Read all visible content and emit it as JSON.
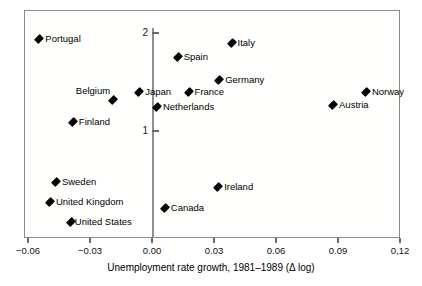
{
  "chart_data": {
    "type": "scatter",
    "title": "",
    "xlabel": "Unemployment rate growth, 1981–1989 (Δ log)",
    "ylabel": "",
    "xlim": [
      -0.075,
      0.1325
    ],
    "ylim": [
      0.08,
      2.15
    ],
    "grid": false,
    "legend": "none",
    "xticks": [
      {
        "value": -0.06,
        "label": "−0.06"
      },
      {
        "value": -0.03,
        "label": "−0.03"
      },
      {
        "value": 0.0,
        "label": "0.00"
      },
      {
        "value": 0.03,
        "label": "0.03"
      },
      {
        "value": 0.06,
        "label": "0.06"
      },
      {
        "value": 0.09,
        "label": "0.09"
      },
      {
        "value": 0.12,
        "label": "0,12"
      }
    ],
    "yticks": [
      {
        "value": 2,
        "label": "2"
      },
      {
        "value": 1,
        "label": "1"
      }
    ],
    "points": [
      {
        "label": "Portugal",
        "x": -0.0545,
        "y": 1.934,
        "label_pos": "right"
      },
      {
        "label": "Italy",
        "x": 0.0385,
        "y": 1.897,
        "label_pos": "right"
      },
      {
        "label": "Spain",
        "x": 0.0124,
        "y": 1.755,
        "label_pos": "right"
      },
      {
        "label": "Germany",
        "x": 0.0325,
        "y": 1.52,
        "label_pos": "right"
      },
      {
        "label": "Norway",
        "x": 0.1035,
        "y": 1.398,
        "label_pos": "right"
      },
      {
        "label": "France",
        "x": 0.0177,
        "y": 1.398,
        "label_pos": "right"
      },
      {
        "label": "Japan",
        "x": -0.0062,
        "y": 1.398,
        "label_pos": "right"
      },
      {
        "label": "Belgium",
        "x": -0.0188,
        "y": 1.316,
        "label_pos": "above-left"
      },
      {
        "label": "Austria",
        "x": 0.0876,
        "y": 1.265,
        "label_pos": "right"
      },
      {
        "label": "Netherlands",
        "x": 0.0024,
        "y": 1.245,
        "label_pos": "right"
      },
      {
        "label": "Finland",
        "x": -0.0383,
        "y": 1.092,
        "label_pos": "right"
      },
      {
        "label": "Sweden",
        "x": -0.0465,
        "y": 0.479,
        "label_pos": "right"
      },
      {
        "label": "Ireland",
        "x": 0.032,
        "y": 0.429,
        "label_pos": "right"
      },
      {
        "label": "United Kingdom",
        "x": -0.0494,
        "y": 0.276,
        "label_pos": "right"
      },
      {
        "label": "Canada",
        "x": 0.0062,
        "y": 0.214,
        "label_pos": "right"
      },
      {
        "label": "United States",
        "x": -0.0393,
        "y": 0.071,
        "label_pos": "right-tight"
      }
    ],
    "colors": {
      "marker": "#000000",
      "frame": "#8a8a8a",
      "axis": "#8e8e8e",
      "text": "#000000",
      "background": "#ffffff"
    }
  }
}
